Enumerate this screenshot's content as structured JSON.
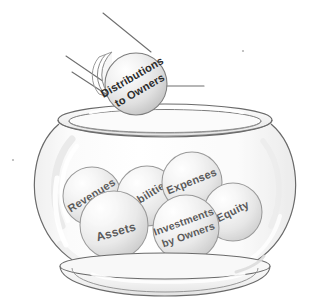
{
  "illustration": {
    "title": "Accounting Elements Fishbowl",
    "background_color": "#ffffff",
    "ink_color": "#5a5a5a",
    "label_color": "#2b2b2b",
    "sphere_fill_light": "#fdfdfd",
    "sphere_fill_mid": "#e2e2e2",
    "sphere_fill_dark": "#c9c9c9",
    "glass_fill": "#f4f4f4",
    "glass_stroke": "#6a6a6a"
  },
  "falling_sphere": {
    "name": "distributions-to-owners",
    "label_line_1": "Distributions",
    "label_line_2": "to Owners",
    "rotation_deg": -30,
    "cx": 136,
    "cy": 84,
    "r": 31,
    "font_size": 11
  },
  "motion_trail": {
    "name": "motion-trail",
    "ghost_count": 3,
    "streak_count": 3
  },
  "bowl_spheres": [
    {
      "name": "revenues",
      "label_line_1": "Revenues",
      "label_line_2": "",
      "rotation_deg": -32,
      "cx": 92,
      "cy": 196,
      "r": 29,
      "font_size": 11
    },
    {
      "name": "liabilities",
      "label_line_1": "Liabilities",
      "label_line_2": "",
      "rotation_deg": -32,
      "cx": 147,
      "cy": 196,
      "r": 30,
      "font_size": 11
    },
    {
      "name": "expenses",
      "label_line_1": "Expenses",
      "label_line_2": "",
      "rotation_deg": -22,
      "cx": 192,
      "cy": 182,
      "r": 30,
      "font_size": 11
    },
    {
      "name": "equity",
      "label_line_1": "Equity",
      "label_line_2": "",
      "rotation_deg": -26,
      "cx": 233,
      "cy": 212,
      "r": 29,
      "font_size": 11
    },
    {
      "name": "assets",
      "label_line_1": "Assets",
      "label_line_2": "",
      "rotation_deg": -16,
      "cx": 114,
      "cy": 225,
      "r": 34,
      "font_size": 12
    },
    {
      "name": "investments-by-owners",
      "label_line_1": "Investments",
      "label_line_2": "by Owners",
      "rotation_deg": -20,
      "cx": 186,
      "cy": 228,
      "r": 33,
      "font_size": 10.5
    }
  ],
  "glass_bowl": {
    "name": "glass-bowl",
    "rim_label": "bowl-rim",
    "body_label": "bowl-body",
    "base_label": "bowl-base",
    "rim_cx": 165,
    "rim_cy": 120,
    "rim_rx": 107,
    "rim_ry": 16,
    "base_cx": 165,
    "base_cy": 278,
    "base_rx": 95,
    "base_ry": 14
  },
  "specks": [
    {
      "name": "speck-left",
      "cx": 13,
      "cy": 160,
      "r": 1.1
    },
    {
      "name": "speck-right",
      "cx": 243,
      "cy": 51,
      "r": 1.1
    }
  ]
}
